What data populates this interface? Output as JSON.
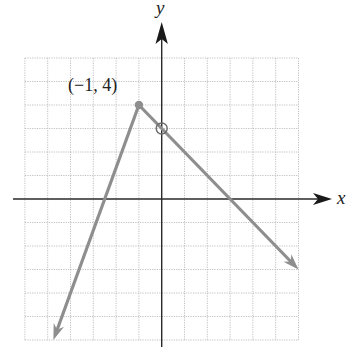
{
  "chart_data": {
    "type": "line",
    "title": "",
    "xlabel": "x",
    "ylabel": "y",
    "xlim": [
      -6,
      6
    ],
    "ylim": [
      -6,
      6
    ],
    "grid": true,
    "grid_step": 1,
    "tick_labels": false,
    "series": [
      {
        "name": "left branch",
        "points": [
          [
            -1,
            4
          ],
          [
            -4.75,
            -6
          ]
        ],
        "slope": 2.6667,
        "x_intercept": -2.5,
        "end": "arrow",
        "color": "#8e8e8e"
      },
      {
        "name": "right branch",
        "points": [
          [
            -1,
            4
          ],
          [
            6,
            -3
          ]
        ],
        "slope": -1,
        "y_intercept": 3,
        "x_intercept": 3,
        "end": "arrow",
        "color": "#8e8e8e"
      }
    ],
    "markers": [
      {
        "x": -1,
        "y": 4,
        "style": "closed"
      },
      {
        "x": 0,
        "y": 3,
        "style": "open"
      }
    ],
    "annotations": [
      {
        "text": "(−1, 4)",
        "x": -1,
        "y": 4
      }
    ]
  },
  "labels": {
    "x_axis": "x",
    "y_axis": "y",
    "vertex": "(−1, 4)"
  }
}
